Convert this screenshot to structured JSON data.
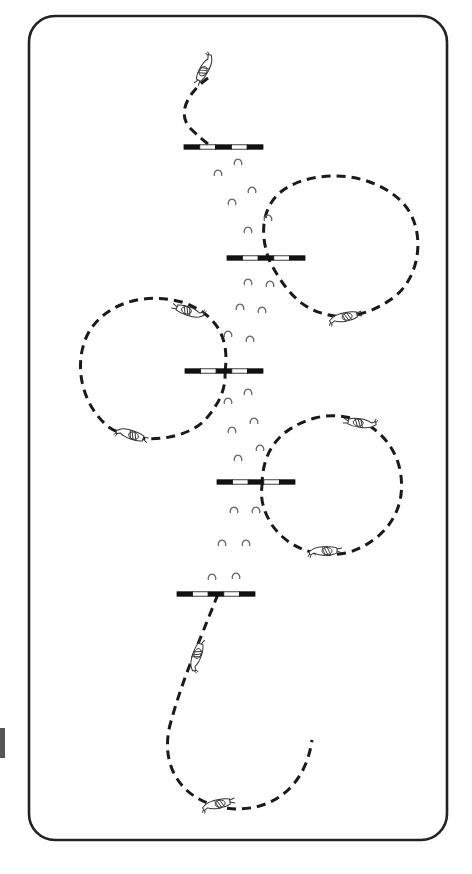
{
  "diagram": {
    "title": "",
    "frame": {
      "x": 29,
      "y": 16,
      "w": 418,
      "h": 824,
      "r": 26,
      "stroke": "#222222"
    },
    "colors": {
      "path": "#1a1a1a",
      "pole_dark": "#111111",
      "pole_light": "#ffffff",
      "hoof": "#666666",
      "horse": "#333333"
    },
    "poles": [
      {
        "id": "pole-1",
        "x1": 184,
        "x2": 263,
        "y": 147
      },
      {
        "id": "pole-2",
        "x1": 227,
        "x2": 305,
        "y": 258
      },
      {
        "id": "pole-3",
        "x1": 185,
        "x2": 263,
        "y": 371
      },
      {
        "id": "pole-4",
        "x1": 217,
        "x2": 295,
        "y": 482
      },
      {
        "id": "pole-5",
        "x1": 177,
        "x2": 255,
        "y": 594
      }
    ],
    "paths": [
      {
        "id": "entry-path",
        "d": "M 208 78 C 185 95, 178 115, 190 128 C 198 136, 205 142, 212 147"
      },
      {
        "id": "circle-right-1",
        "d": "M 270 262 C 258 232, 262 200, 290 186 C 320 170, 370 172, 400 200 C 428 226, 422 280, 390 300 C 370 314, 345 320, 325 314 C 300 308, 285 290, 270 262"
      },
      {
        "id": "circle-left",
        "d": "M 225 372 C 230 335, 215 315, 185 303 C 150 292, 110 300, 90 330 C 72 360, 80 405, 110 428 C 140 446, 185 440, 205 420 C 220 403, 226 388, 225 372"
      },
      {
        "id": "circle-right-2",
        "d": "M 262 486 C 262 450, 280 428, 315 418 C 355 408, 392 432, 400 470 C 408 510, 385 540, 350 552 C 318 560, 288 548, 272 525 C 264 512, 260 500, 262 486"
      },
      {
        "id": "exit-path",
        "d": "M 218 594 C 200 640, 182 680, 170 725 C 160 765, 180 800, 225 808 C 268 814, 305 790, 312 740"
      }
    ],
    "horses": [
      {
        "id": "horse-start",
        "x": 205,
        "y": 70,
        "angle": -60,
        "label": "horse-rider-start"
      },
      {
        "id": "horse-circle-right-1",
        "x": 345,
        "y": 316,
        "angle": 170,
        "label": "horse-rider"
      },
      {
        "id": "horse-circle-left-top",
        "x": 188,
        "y": 312,
        "angle": 20,
        "label": "horse-rider"
      },
      {
        "id": "horse-circle-left-bottom",
        "x": 132,
        "y": 434,
        "angle": -160,
        "label": "horse-rider"
      },
      {
        "id": "horse-circle-right-2-top",
        "x": 360,
        "y": 424,
        "angle": 10,
        "label": "horse-rider"
      },
      {
        "id": "horse-circle-right-2-bottom",
        "x": 325,
        "y": 550,
        "angle": 180,
        "label": "horse-rider"
      },
      {
        "id": "horse-exit-mid",
        "x": 196,
        "y": 655,
        "angle": 110,
        "label": "horse-rider"
      },
      {
        "id": "horse-finish",
        "x": 218,
        "y": 803,
        "angle": 170,
        "label": "horse-rider-finish"
      }
    ],
    "hoofprints": [
      {
        "x": 238,
        "y": 162
      },
      {
        "x": 218,
        "y": 173
      },
      {
        "x": 252,
        "y": 190
      },
      {
        "x": 232,
        "y": 202
      },
      {
        "x": 268,
        "y": 218
      },
      {
        "x": 248,
        "y": 230
      },
      {
        "x": 248,
        "y": 282
      },
      {
        "x": 270,
        "y": 284
      },
      {
        "x": 240,
        "y": 307
      },
      {
        "x": 262,
        "y": 310
      },
      {
        "x": 228,
        "y": 334
      },
      {
        "x": 250,
        "y": 339
      },
      {
        "x": 248,
        "y": 392
      },
      {
        "x": 228,
        "y": 401
      },
      {
        "x": 254,
        "y": 421
      },
      {
        "x": 232,
        "y": 430
      },
      {
        "x": 260,
        "y": 448
      },
      {
        "x": 238,
        "y": 458
      },
      {
        "x": 234,
        "y": 510
      },
      {
        "x": 256,
        "y": 510
      },
      {
        "x": 222,
        "y": 543
      },
      {
        "x": 246,
        "y": 543
      },
      {
        "x": 212,
        "y": 577
      },
      {
        "x": 236,
        "y": 576
      }
    ]
  }
}
